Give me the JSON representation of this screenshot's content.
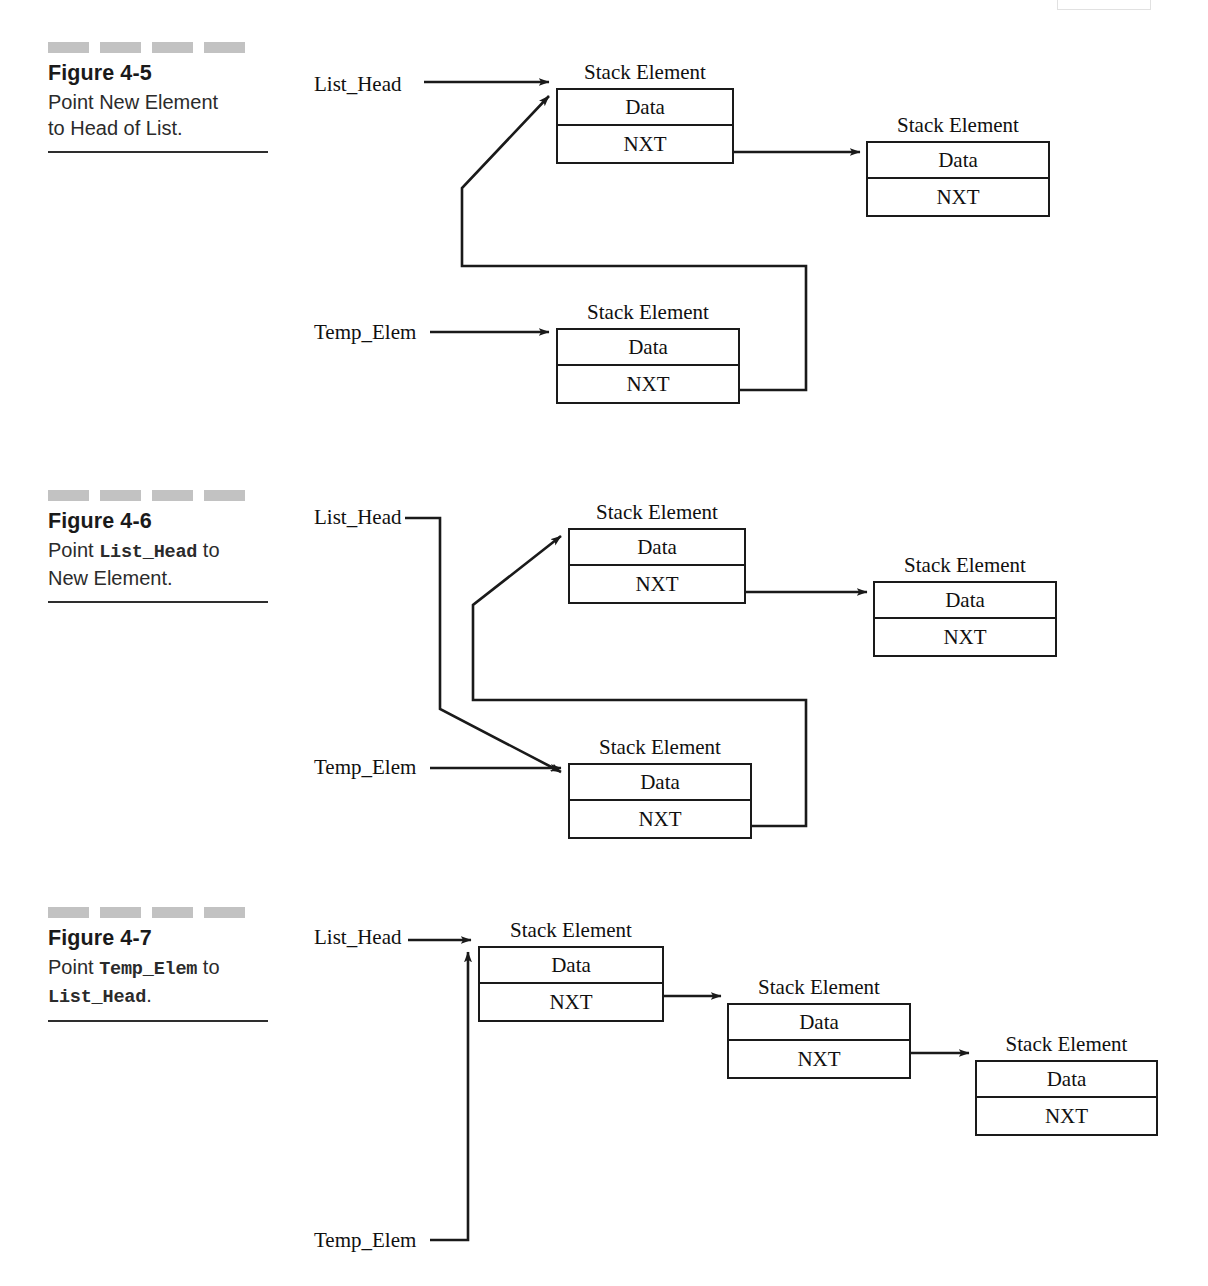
{
  "page": {
    "number_artifact": "105"
  },
  "node_labels": {
    "title": "Stack Element",
    "data_cell": "Data",
    "next_cell": "NXT"
  },
  "pointers": {
    "list_head": "List_Head",
    "temp_elem": "Temp_Elem"
  },
  "figures": [
    {
      "id": "figure-4-5",
      "title": "Figure 4-5",
      "description_parts": [
        {
          "text": "Point New Element",
          "style": "plain"
        },
        {
          "text": "to Head of List.",
          "style": "plain"
        }
      ],
      "description_plain": "Point New Element to Head of List.",
      "pointer_labels": [
        "List_Head",
        "Temp_Elem"
      ],
      "node_count": 3
    },
    {
      "id": "figure-4-6",
      "title": "Figure 4-6",
      "description_parts": [
        {
          "text": "Point ",
          "style": "plain"
        },
        {
          "text": "List_Head",
          "style": "mono"
        },
        {
          "text": " to",
          "style": "plain"
        },
        {
          "text": "New Element.",
          "style": "plain"
        }
      ],
      "description_plain": "Point List_Head to New Element.",
      "pointer_labels": [
        "List_Head",
        "Temp_Elem"
      ],
      "node_count": 3
    },
    {
      "id": "figure-4-7",
      "title": "Figure 4-7",
      "description_parts": [
        {
          "text": "Point ",
          "style": "plain"
        },
        {
          "text": "Temp_Elem",
          "style": "mono"
        },
        {
          "text": " to",
          "style": "plain"
        },
        {
          "text": "List_Head",
          "style": "mono"
        },
        {
          "text": ".",
          "style": "plain"
        }
      ],
      "description_plain": "Point Temp_Elem to List_Head.",
      "pointer_labels": [
        "List_Head",
        "Temp_Elem"
      ],
      "node_count": 3
    }
  ],
  "colors": {
    "ink": "#1a1a1a",
    "dash_gray": "#c2c2c2",
    "rule": "#2e2e2e",
    "paper": "#ffffff"
  }
}
